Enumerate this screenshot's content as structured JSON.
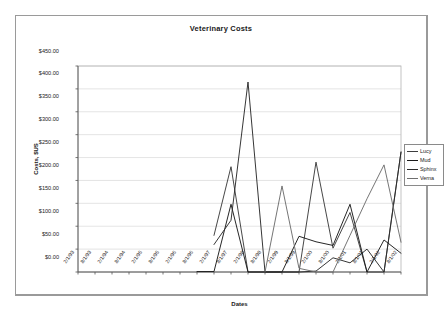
{
  "chart_data": {
    "type": "line",
    "title": "Veterinary Costs",
    "xlabel": "Dates",
    "ylabel": "Costs, $US",
    "ylim": [
      0,
      450
    ],
    "ytick_labels": [
      "$0.00",
      "$50.00",
      "$100.00",
      "$150.00",
      "$200.00",
      "$250.00",
      "$300.00",
      "$350.00",
      "$400.00",
      "$450.00"
    ],
    "ytick_values": [
      0,
      50,
      100,
      150,
      200,
      250,
      300,
      350,
      400,
      450
    ],
    "grid": "horizontal",
    "legend_position": "right",
    "categories": [
      "2/1/93",
      "8/1/93",
      "2/1/94",
      "8/1/94",
      "2/1/95",
      "8/1/95",
      "2/1/96",
      "8/1/96",
      "2/1/97",
      "8/1/97",
      "2/1/98",
      "8/1/98",
      "2/1/99",
      "8/1/99",
      "2/1/00",
      "8/1/00",
      "2/1/01",
      "8/1/01",
      "2/1/02",
      "8/1/02"
    ],
    "series": [
      {
        "name": "Lucy",
        "color": "#3d3d3d",
        "values": [
          null,
          null,
          null,
          null,
          null,
          null,
          null,
          null,
          80,
          230,
          0,
          0,
          0,
          0,
          240,
          52,
          130,
          0,
          0,
          262
        ]
      },
      {
        "name": "Mud",
        "color": "#1a1a1a",
        "values": [
          31,
          null,
          null,
          null,
          null,
          null,
          null,
          1,
          1,
          148,
          0,
          0,
          0,
          78,
          66,
          58,
          148,
          0,
          70,
          41
        ]
      },
      {
        "name": "Sphinx",
        "color": "#2b2b2b",
        "values": [
          null,
          null,
          null,
          null,
          null,
          null,
          null,
          null,
          60,
          113,
          415,
          0,
          0,
          0,
          2,
          31,
          20,
          50,
          0,
          262
        ]
      },
      {
        "name": "Verna",
        "color": "#6e6e6e",
        "values": [
          null,
          null,
          null,
          null,
          null,
          null,
          null,
          null,
          null,
          null,
          null,
          0,
          188,
          8,
          0,
          0,
          80,
          160,
          234,
          65
        ]
      }
    ]
  },
  "legend": {
    "entries": [
      {
        "label": "Lucy"
      },
      {
        "label": "Mud"
      },
      {
        "label": "Sphinx"
      },
      {
        "label": "Verna"
      }
    ]
  }
}
